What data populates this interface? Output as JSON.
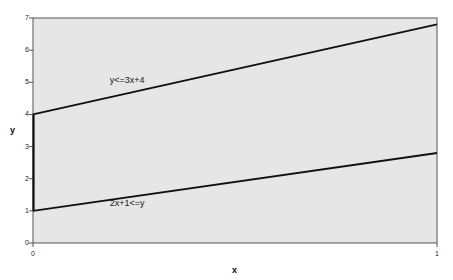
{
  "chart_data": {
    "type": "line",
    "title": "",
    "subtitle": "",
    "xlabel": "x",
    "ylabel": "y",
    "xlim": [
      0,
      1
    ],
    "ylim": [
      0,
      7
    ],
    "x_ticks": [
      "0",
      "1"
    ],
    "x_tick_values": [
      0,
      1
    ],
    "y_ticks": [
      "0",
      "1",
      "2",
      "3",
      "4",
      "5",
      "6",
      "7"
    ],
    "y_tick_values": [
      0,
      1,
      2,
      3,
      4,
      5,
      6,
      7
    ],
    "grid": false,
    "legend": "none",
    "plot_background": "#e6e6e6",
    "line_color": "#111111",
    "border_color": "#555555",
    "series": [
      {
        "name": "y<=3x+4",
        "label": "y<=3x+4",
        "x": [
          0,
          1
        ],
        "values": [
          4,
          6.8
        ],
        "slope": 3,
        "intercept": 4
      },
      {
        "name": "2x+1<=y",
        "label": "2x+1<=y",
        "x": [
          0,
          1
        ],
        "values": [
          1,
          2.8
        ],
        "slope": 2,
        "intercept": 1
      }
    ],
    "annotations": [
      {
        "text": "y<=3x+4",
        "x": 0.19,
        "y": 5.05
      },
      {
        "text": "2x+1<=y",
        "x": 0.19,
        "y": 1.2
      }
    ],
    "region_edge": {
      "x": 0,
      "y_from": 1,
      "y_to": 4
    }
  }
}
